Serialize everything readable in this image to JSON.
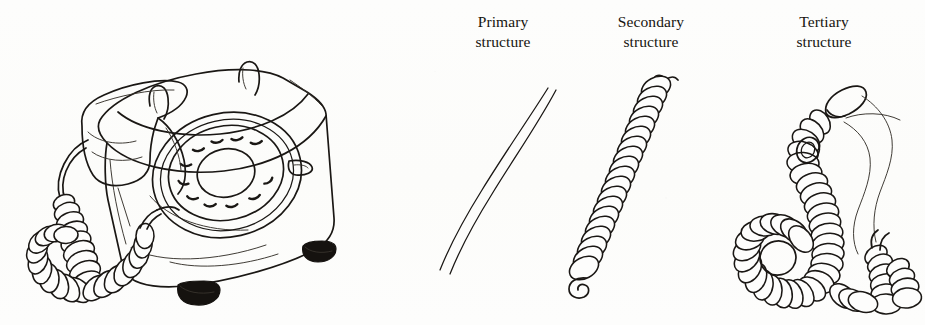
{
  "figure": {
    "kind": "line-drawing-illustration",
    "background_color": "#fdfdfc",
    "ink_color": "#1a1714",
    "width": 925,
    "height": 325
  },
  "labels": {
    "primary": "Primary\nstructure",
    "secondary": "Secondary\nstructure",
    "tertiary": "Tertiary\nstructure"
  },
  "panels": [
    {
      "id": "telephone",
      "name": "rotary-telephone",
      "caption": "",
      "description": "Rotary dial desk telephone with handset on cradle and coiled handset cord"
    },
    {
      "id": "primary",
      "name": "primary-structure",
      "caption": "Primary\nstructure",
      "description": "Uncoiled, extended telephone cord drawn as two gently curved parallel lines"
    },
    {
      "id": "secondary",
      "name": "secondary-structure",
      "caption": "Secondary\nstructure",
      "description": "Cord wound into a regular helical coil running diagonally"
    },
    {
      "id": "tertiary",
      "name": "tertiary-structure",
      "caption": "Tertiary\nstructure",
      "description": "Coiled cord further folded and looped back on itself into a compact tangle"
    }
  ]
}
